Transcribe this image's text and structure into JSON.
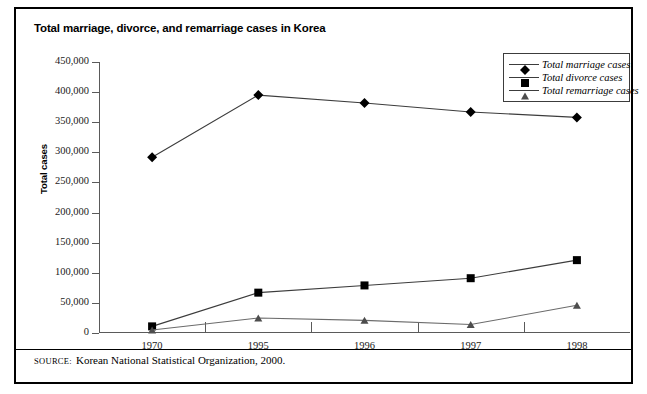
{
  "figure": {
    "title": "Total marriage, divorce, and remarriage cases in Korea",
    "source_keyword": "SOURCE:",
    "source_text": "Korean National Statistical Organization, 2000.",
    "frame_color": "#000000",
    "axis_color": "#5a5a5a"
  },
  "chart_data": {
    "type": "line",
    "title": "Total marriage, divorce, and remarriage cases in Korea",
    "xlabel": "",
    "ylabel": "Total cases",
    "categories": [
      "1970",
      "1995",
      "1996",
      "1997",
      "1998"
    ],
    "ylim": [
      0,
      450000
    ],
    "ytick_step": 50000,
    "yticks": [
      "450,000",
      "400,000",
      "350,000",
      "300,000",
      "250,000",
      "200,000",
      "150,000",
      "100,000",
      "50,000",
      "0"
    ],
    "ytick_values": [
      450000,
      400000,
      350000,
      300000,
      250000,
      200000,
      150000,
      100000,
      50000,
      0
    ],
    "grid": false,
    "legend_position": "top-right",
    "series": [
      {
        "name": "Total marriage cases",
        "marker": "diamond",
        "color": "#000000",
        "values": [
          292000,
          395000,
          382000,
          367000,
          358000
        ]
      },
      {
        "name": "Total divorce cases",
        "marker": "square",
        "color": "#000000",
        "values": [
          11000,
          67000,
          79000,
          91000,
          121000
        ]
      },
      {
        "name": "Total remarriage cases",
        "marker": "triangle",
        "color": "#4d4d4d",
        "values": [
          5000,
          25000,
          21000,
          14000,
          46000
        ]
      }
    ]
  }
}
